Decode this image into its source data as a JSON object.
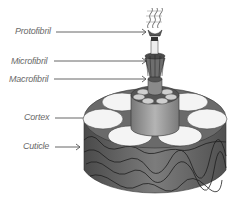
{
  "diagram": {
    "labels": [
      {
        "id": "protofibril",
        "text": "Protofibril"
      },
      {
        "id": "microfibril",
        "text": "Microfibril"
      },
      {
        "id": "macrofibril",
        "text": "Macrofibril"
      },
      {
        "id": "cortex",
        "text": "Cortex"
      },
      {
        "id": "cuticle",
        "text": "Cuticle"
      }
    ],
    "colors": {
      "label_text": "#6a6a6a",
      "arrow": "#555555",
      "cuticle_dark": "#5a5a5a",
      "cuticle_mid": "#7a7a7a",
      "cortex_cells": "#f4f4f4",
      "macrofibril_body": "#9a9a9a"
    }
  }
}
